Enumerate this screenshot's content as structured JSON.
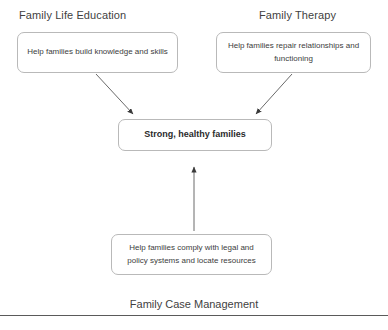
{
  "diagram": {
    "title_left": "Family Life Education",
    "title_right": "Family Therapy",
    "caption_bottom": "Family Case Management",
    "boxes": {
      "family_life_education": "Help families build knowledge and skills",
      "family_therapy": "Help families repair relationships and functioning",
      "outcome": "Strong, healthy families",
      "family_case_management": "Help families comply with legal and policy systems and locate resources"
    },
    "arrows": [
      {
        "name": "arrow-family-life-education-to-outcome",
        "from": "family_life_education",
        "to": "outcome",
        "direction": "down-right"
      },
      {
        "name": "arrow-family-therapy-to-outcome",
        "from": "family_therapy",
        "to": "outcome",
        "direction": "down-left"
      },
      {
        "name": "arrow-family-case-management-to-outcome",
        "from": "family_case_management",
        "to": "outcome",
        "direction": "up"
      }
    ],
    "colors": {
      "background": "#ffffff",
      "box_border": "#b9b9b9",
      "text": "#3f3f3f",
      "arrow": "#4a4a4a",
      "rule": "#5a5a5a"
    }
  }
}
